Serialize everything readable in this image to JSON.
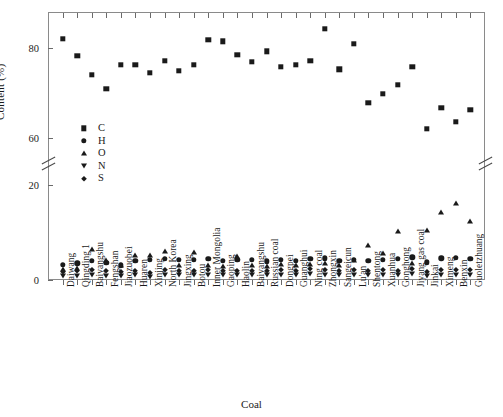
{
  "chart_data": {
    "type": "scatter",
    "title": "",
    "xlabel": "Coal",
    "ylabel": "Content (%)",
    "ylim": [
      -2,
      90
    ],
    "y_axis_break": {
      "between": [
        20,
        60
      ],
      "lower_ticks": [
        0,
        20
      ],
      "upper_ticks": [
        60,
        80
      ]
    },
    "yticks": [
      0,
      20,
      60,
      80
    ],
    "grid": false,
    "legend_position": "inner-left",
    "legend": [
      "C",
      "H",
      "O",
      "N",
      "S"
    ],
    "markers": {
      "C": "square",
      "H": "circle",
      "O": "triangle-up",
      "N": "triangle-down",
      "S": "diamond"
    },
    "marker_color": "#1a1a1a",
    "categories": [
      "Daiwang",
      "Qingding 1",
      "Baiyangshu",
      "Fengshan",
      "Jiaozuobei",
      "Huaren",
      "Xinjing",
      "North Korea",
      "Jingxing",
      "Botou",
      "Inner Mongolia",
      "Gaoping",
      "Haolin",
      "Baiyangshu",
      "Russian coal",
      "Dongpei",
      "Guanghui",
      "Ning coal",
      "Zhongxin",
      "Sangeicun",
      "Lu'an",
      "Shentong",
      "Xuanhua",
      "Gonghong",
      "Jiyang gas coal",
      "Jinkai",
      "Ximeng",
      "Benxin",
      "Guoletzhuang"
    ],
    "series": [
      {
        "name": "C",
        "values": [
          82.0,
          78.3,
          74.0,
          71.0,
          76.3,
          76.3,
          74.5,
          77.2,
          75.0,
          76.2,
          81.8,
          81.5,
          78.5,
          77.0,
          79.3,
          75.8,
          76.2,
          77.2,
          84.3,
          75.3,
          81.0,
          67.8,
          69.8,
          71.8,
          75.8,
          62.0,
          66.7,
          63.6,
          66.3
        ]
      },
      {
        "name": "H",
        "values": [
          3.2,
          3.5,
          4.0,
          3.6,
          3.1,
          4.1,
          4.2,
          4.4,
          4.3,
          4.2,
          4.4,
          4.0,
          4.3,
          4.2,
          3.9,
          4.3,
          4.1,
          4.5,
          4.6,
          4.1,
          4.3,
          4.0,
          4.3,
          4.4,
          4.8,
          3.7,
          4.6,
          4.7,
          4.5
        ]
      },
      {
        "name": "O",
        "values": [
          2.3,
          2.6,
          6.6,
          4.2,
          3.1,
          5.3,
          5.3,
          6.2,
          3.1,
          5.8,
          3.2,
          2.9,
          5.1,
          3.2,
          3.0,
          3.3,
          3.1,
          3.3,
          3.5,
          3.2,
          4.3,
          7.3,
          5.6,
          10.3,
          3.6,
          10.6,
          14.3,
          16.2,
          12.4
        ]
      },
      {
        "name": "N",
        "values": [
          0.9,
          0.8,
          1.0,
          0.9,
          0.9,
          1.0,
          0.7,
          1.1,
          1.0,
          1.0,
          1.1,
          1.0,
          1.0,
          1.0,
          1.0,
          1.1,
          1.0,
          1.2,
          1.1,
          1.0,
          1.1,
          1.0,
          1.1,
          1.0,
          1.2,
          0.8,
          1.1,
          1.0,
          1.0
        ]
      },
      {
        "name": "S",
        "values": [
          1.6,
          1.8,
          2.1,
          1.8,
          1.7,
          2.0,
          1.5,
          2.2,
          2.0,
          2.0,
          2.1,
          1.9,
          2.0,
          1.9,
          1.9,
          2.1,
          1.9,
          2.3,
          2.2,
          1.9,
          2.2,
          1.9,
          2.1,
          2.0,
          2.4,
          1.7,
          2.2,
          2.1,
          2.1
        ]
      }
    ]
  }
}
